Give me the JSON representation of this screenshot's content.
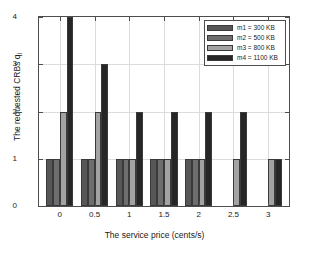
{
  "chart_data": {
    "type": "bar",
    "title": "",
    "xlabel": "The service price (cents/s)",
    "ylabel": "The requested CRBs q",
    "ylabel_subscript": "i",
    "categories": [
      "0",
      "0.5",
      "1",
      "1.5",
      "2",
      "2.5",
      "3"
    ],
    "x": [
      0,
      0.5,
      1,
      1.5,
      2,
      2.5,
      3
    ],
    "series": [
      {
        "name": "m1 = 300 KB",
        "color": "#575757",
        "values": [
          1,
          1,
          1,
          1,
          1,
          0,
          0
        ]
      },
      {
        "name": "m2 = 500 KB",
        "color": "#6e6e6e",
        "values": [
          1,
          1,
          1,
          1,
          1,
          0,
          0
        ]
      },
      {
        "name": "m3 = 800 KB",
        "color": "#a3a3a3",
        "values": [
          2,
          2,
          1,
          1,
          1,
          1,
          1
        ]
      },
      {
        "name": "m4 = 1100 KB",
        "color": "#262626",
        "values": [
          4,
          3,
          2,
          2,
          2,
          2,
          1
        ]
      }
    ],
    "xticklabels": [
      "0",
      "0.5",
      "1",
      "1.5",
      "2",
      "2.5",
      "3"
    ],
    "yticklabels": [
      "0",
      "1",
      "2",
      "3",
      "4"
    ],
    "yticks": [
      0,
      1,
      2,
      3,
      4
    ],
    "ylim": [
      0,
      4
    ],
    "xlim": [
      -0.3,
      3.3
    ],
    "grid": true,
    "legend_position": "top-right",
    "legend_entries": [
      "m1 = 300 KB",
      "m2 = 500 KB",
      "m3 = 800 KB",
      "m4 = 1100 KB"
    ]
  },
  "figure": {
    "background": "#ffffff",
    "axis_color": "#4d4d4d",
    "grid_color": "#dcdcdc"
  }
}
